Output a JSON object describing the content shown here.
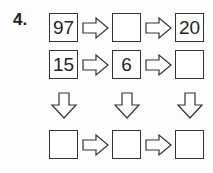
{
  "problem_number": "4.",
  "grid": {
    "row1": [
      "97",
      "",
      "20"
    ],
    "row2": [
      "15",
      "6",
      ""
    ],
    "row4": [
      "",
      "",
      ""
    ]
  },
  "colors": {
    "stroke": "#333333",
    "text": "#222222"
  }
}
